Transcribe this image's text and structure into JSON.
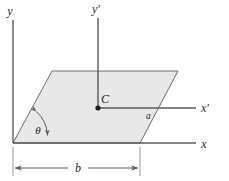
{
  "figure": {
    "type": "engineering-diagram",
    "background_color": "#ffffff",
    "stroke_color": "#5a5a5a",
    "dark_stroke_color": "#231f20",
    "plate_fill_color": "#e8e8e8",
    "plate_edge_color": "#6b6b6b",
    "labels": {
      "y_axis": "y",
      "y_prime_axis": "y′",
      "x_axis": "x",
      "x_prime_axis": "x′",
      "centroid": "C",
      "side_a": "a",
      "base_b": "b",
      "angle_theta": "θ"
    },
    "geometry": {
      "origin": [
        13,
        143
      ],
      "plate_corners": [
        [
          13,
          143
        ],
        [
          52,
          71
        ],
        [
          178,
          71
        ],
        [
          140,
          143
        ]
      ],
      "centroid_point": [
        98,
        108
      ],
      "y_axis_top": [
        13,
        20
      ],
      "y_prime_axis_top": [
        98,
        18
      ],
      "x_axis_right": [
        196,
        143
      ],
      "x_prime_axis_right": [
        196,
        108
      ],
      "dimension_line_y": 168,
      "dimension_from_x": 13,
      "dimension_to_x": 140
    }
  }
}
